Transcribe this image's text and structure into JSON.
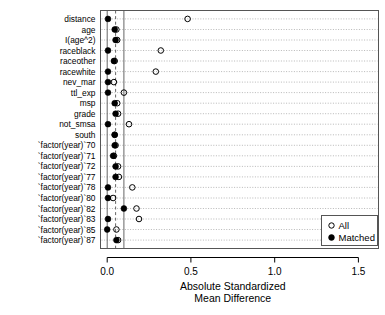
{
  "chart_data": {
    "type": "scatter",
    "title": "",
    "xlabel": "Absolute Standardized Mean Difference",
    "xlabel_line1": "Absolute Standardized",
    "xlabel_line2": "Mean Difference",
    "ylabel": "",
    "xlim": [
      -0.04,
      1.62
    ],
    "xticks": [
      0.0,
      0.5,
      1.0,
      1.5
    ],
    "xticklabels": [
      "0.0",
      "0.5",
      "1.0",
      "1.5"
    ],
    "grid": true,
    "grid_orientation": "horizontal-dotted",
    "reference_lines": [
      {
        "x": 0.0,
        "style": "solid"
      },
      {
        "x": 0.05,
        "style": "dashed"
      },
      {
        "x": 0.1,
        "style": "solid"
      }
    ],
    "legend": {
      "position": "bottom-right",
      "entries": [
        {
          "label": "All",
          "marker": "open-circle"
        },
        {
          "label": "Matched",
          "marker": "filled-circle"
        }
      ]
    },
    "categories": [
      "distance",
      "age",
      "I(age^2)",
      "raceblack",
      "raceother",
      "racewhite",
      "nev_mar",
      "ttl_exp",
      "msp",
      "grade",
      "not_smsa",
      "south",
      "`factor(year)`70",
      "`factor(year)`71",
      "`factor(year)`72",
      "`factor(year)`77",
      "`factor(year)`78",
      "`factor(year)`80",
      "`factor(year)`82",
      "`factor(year)`83",
      "`factor(year)`85",
      "`factor(year)`87"
    ],
    "series": [
      {
        "name": "All",
        "marker": "open-circle",
        "values": [
          0.48,
          0.055,
          0.06,
          0.32,
          0.045,
          0.29,
          0.04,
          0.1,
          0.06,
          0.065,
          0.13,
          0.045,
          0.05,
          0.04,
          0.065,
          0.07,
          0.15,
          0.035,
          0.175,
          0.19,
          0.055,
          0.065
        ]
      },
      {
        "name": "Matched",
        "marker": "filled-circle",
        "values": [
          0.005,
          0.045,
          0.05,
          0.005,
          0.04,
          0.005,
          0.005,
          0.005,
          0.045,
          0.05,
          0.005,
          0.045,
          0.045,
          0.035,
          0.05,
          0.05,
          0.005,
          0.005,
          0.1,
          0.005,
          0.0,
          0.055
        ]
      }
    ]
  },
  "legend": {
    "all_label": "All",
    "matched_label": "Matched"
  },
  "axis": {
    "x_title_line1": "Absolute Standardized",
    "x_title_line2": "Mean Difference"
  }
}
